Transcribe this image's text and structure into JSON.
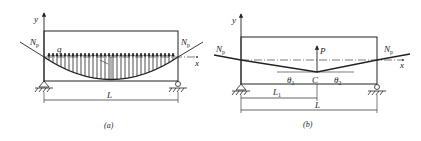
{
  "figure": {
    "panels": [
      {
        "id": "a",
        "caption": "(a)",
        "axis_x": "x",
        "axis_y": "y",
        "force_left": "N",
        "force_left_sub": "p",
        "force_right": "N",
        "force_right_sub": "p",
        "load_label": "q",
        "span_label": "L",
        "tendon_shape": "parabolic",
        "description": "Simply supported beam with parabolic prestressing tendon producing uniform upward load q"
      },
      {
        "id": "b",
        "caption": "(b)",
        "axis_x": "x",
        "axis_y": "y",
        "force_left": "N",
        "force_left_sub": "p",
        "force_right": "N",
        "force_right_sub": "p",
        "point_load_label": "P",
        "point_label": "C",
        "angle1": "θ",
        "angle1_sub": "1",
        "angle2": "θ",
        "angle2_sub": "2",
        "dim1_label": "L",
        "dim1_sub": "1",
        "span_label": "L",
        "tendon_shape": "harped",
        "description": "Simply supported beam with harped tendon producing upward point load P at C"
      }
    ],
    "colors": {
      "line": "#222222",
      "background": "#ffffff"
    }
  }
}
